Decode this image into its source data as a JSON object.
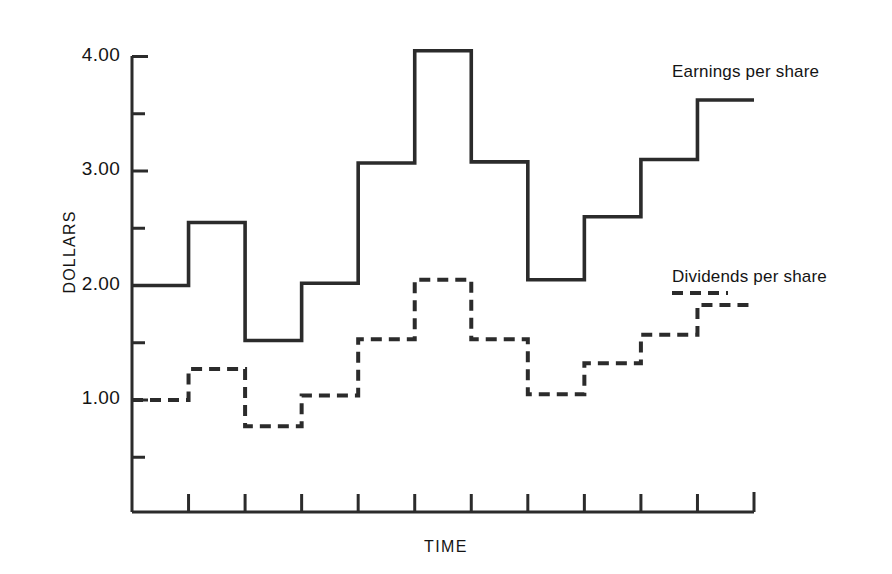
{
  "figure": {
    "background_color": "#ffffff",
    "ink_color": "#2b2b2b"
  },
  "axes": {
    "y_title": "DOLLARS",
    "x_title": "TIME",
    "y_tick_labels": [
      "4.00",
      "3.00",
      "2.00",
      "1.00"
    ]
  },
  "labels": {
    "earnings": "Earnings per share",
    "dividends": "Dividends per share"
  },
  "chart_data": {
    "type": "line",
    "subtype": "step",
    "title": "",
    "xlabel": "TIME",
    "ylabel": "DOLLARS",
    "ylim": [
      0.0,
      4.2
    ],
    "yticks": [
      1.0,
      2.0,
      3.0,
      4.0
    ],
    "ytick_labels": [
      "1.00",
      "2.00",
      "3.00",
      "4.00"
    ],
    "yminor_ticks": [
      0.5,
      1.5,
      2.5,
      3.5
    ],
    "grid": false,
    "legend_position": "inline-right",
    "x_tick_count": 11,
    "x_tick_labels": [],
    "x_periods": [
      "1",
      "2",
      "3",
      "4",
      "5",
      "6",
      "7",
      "8",
      "9",
      "10",
      "11"
    ],
    "series": [
      {
        "name": "Earnings per share",
        "label": "Earnings per share",
        "linestyle": "solid",
        "color": "#2b2b2b",
        "values": [
          2.0,
          2.55,
          1.52,
          2.02,
          3.07,
          4.05,
          3.08,
          2.05,
          2.6,
          3.1,
          3.62
        ]
      },
      {
        "name": "Dividends per share",
        "label": "Dividends per share",
        "linestyle": "dashed",
        "color": "#2b2b2b",
        "values": [
          1.0,
          1.27,
          0.77,
          1.04,
          1.53,
          2.05,
          1.53,
          1.05,
          1.32,
          1.57,
          1.83
        ]
      }
    ]
  }
}
